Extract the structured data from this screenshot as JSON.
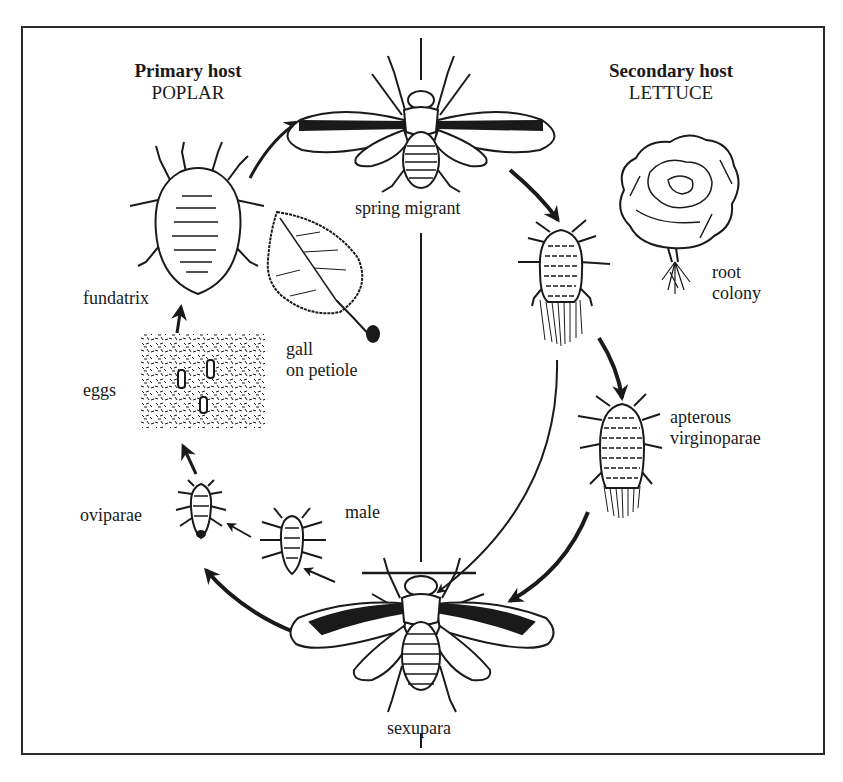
{
  "diagram": {
    "type": "life-cycle",
    "hosts": {
      "primary": {
        "title": "Primary host",
        "plant": "POPLAR"
      },
      "secondary": {
        "title": "Secondary host",
        "plant": "LETTUCE"
      }
    },
    "stages": [
      {
        "id": "spring-migrant",
        "label": "spring migrant"
      },
      {
        "id": "root-colony",
        "label_line1": "root",
        "label_line2": "colony"
      },
      {
        "id": "apterous-virginoparae",
        "label_line1": "apterous",
        "label_line2": "virginoparae"
      },
      {
        "id": "sexupara",
        "label": "sexupara"
      },
      {
        "id": "male",
        "label": "male"
      },
      {
        "id": "oviparae",
        "label": "oviparae"
      },
      {
        "id": "eggs",
        "label": "eggs"
      },
      {
        "id": "fundatrix",
        "label": "fundatrix"
      },
      {
        "id": "gall",
        "label_line1": "gall",
        "label_line2": "on petiole"
      }
    ],
    "flow": [
      [
        "fundatrix",
        "spring-migrant"
      ],
      [
        "spring-migrant",
        "root-colony-aphid"
      ],
      [
        "root-colony-aphid",
        "apterous-virginoparae"
      ],
      [
        "root-colony-aphid",
        "sexupara"
      ],
      [
        "apterous-virginoparae",
        "sexupara"
      ],
      [
        "sexupara",
        "male"
      ],
      [
        "sexupara",
        "oviparae"
      ],
      [
        "male",
        "oviparae"
      ],
      [
        "oviparae",
        "eggs"
      ],
      [
        "eggs",
        "fundatrix"
      ]
    ],
    "colors": {
      "ink": "#1a1a1a",
      "background": "#ffffff"
    }
  }
}
